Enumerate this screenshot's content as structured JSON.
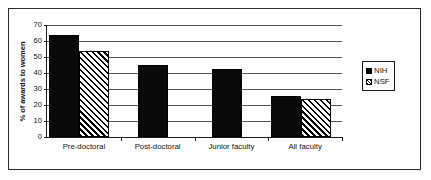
{
  "chart_data": {
    "type": "bar",
    "title": "",
    "subtitle": "",
    "xlabel": "",
    "ylabel": "% of awards to women",
    "ylim": [
      0,
      70
    ],
    "ytick_step": 10,
    "yticks": [
      0,
      10,
      20,
      30,
      40,
      50,
      60,
      70
    ],
    "ytick_labels": [
      "0",
      "10",
      "20",
      "30",
      "40",
      "50",
      "60",
      "70"
    ],
    "grid": true,
    "grid_axis": "y",
    "legend_position": "right",
    "categories": [
      "Pre-doctoral",
      "Post-doctoral",
      "Junior faculty",
      "All faculty"
    ],
    "series": [
      {
        "name": "NIH",
        "color": "#0a0a0a",
        "pattern": "solid",
        "values": [
          64,
          45,
          42.5,
          25.5
        ]
      },
      {
        "name": "NSF",
        "color": "#ffffff",
        "pattern": "diagonal-hatch",
        "values": [
          54,
          null,
          null,
          23.5
        ]
      }
    ]
  },
  "legend": {
    "items": [
      {
        "label": "NIH",
        "swatch": "solid-black-square-icon"
      },
      {
        "label": "NSF",
        "swatch": "hatched-square-icon"
      }
    ]
  },
  "axes": {
    "y_label": "% of awards to women",
    "y_tick_labels": [
      "70",
      "60",
      "50",
      "40",
      "30",
      "20",
      "10",
      "0"
    ],
    "x_tick_labels": [
      "Pre-doctoral",
      "Post-doctoral",
      "Junior faculty",
      "All faculty"
    ]
  },
  "colors": {
    "bar_nih": "#0a0a0a",
    "bar_nsf": "#ffffff",
    "axis": "#1a1a1a",
    "grid": "#555555",
    "frame": "#2b2b2b",
    "background": "#ffffff"
  }
}
